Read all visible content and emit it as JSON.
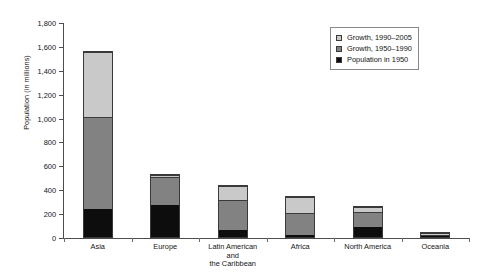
{
  "chart_data": {
    "type": "bar",
    "subtype": "stacked-vertical",
    "title": "",
    "xlabel": "",
    "ylabel": "Population (in millions)",
    "ylim": [
      0,
      1800
    ],
    "ytick_step": 200,
    "ytick_labels": [
      "0",
      "200",
      "400",
      "600",
      "800",
      "1,000",
      "1,200",
      "1,400",
      "1,600",
      "1,800"
    ],
    "ytick_values": [
      0,
      200,
      400,
      600,
      800,
      1000,
      1200,
      1400,
      1600,
      1800
    ],
    "grid": false,
    "legend_position": "top-right",
    "categories": [
      "Asia",
      "Europe",
      "Latin American\nand\nthe Caribbean",
      "Africa",
      "North America",
      "Oceania"
    ],
    "series": [
      {
        "name": "Population in 1950",
        "color": "#0d0d0d",
        "values": [
          240,
          275,
          65,
          22,
          90,
          13
        ]
      },
      {
        "name": "Growth, 1950–1990",
        "color": "#828282",
        "values": [
          770,
          235,
          250,
          178,
          125,
          7
        ]
      },
      {
        "name": "Growth, 1990–2005",
        "color": "#c9c9c9",
        "values": [
          540,
          10,
          110,
          135,
          35,
          13
        ]
      }
    ],
    "totals": [
      1550,
      520,
      425,
      335,
      250,
      33
    ]
  },
  "legend": {
    "entries": [
      {
        "label": "Growth, 1990–2005",
        "swatch": "light-gray-swatch"
      },
      {
        "label": "Growth, 1950–1990",
        "swatch": "mid-gray-swatch"
      },
      {
        "label": "Population in 1950",
        "swatch": "black-swatch"
      }
    ]
  },
  "colors": {
    "population_1950": "#0d0d0d",
    "growth_1950_1990": "#828282",
    "growth_1990_2005": "#c9c9c9",
    "axis": "#4d4d4d",
    "background": "#ffffff"
  }
}
